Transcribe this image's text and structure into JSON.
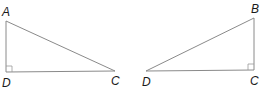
{
  "figure": {
    "triangles": [
      {
        "name": "triangle-ADC",
        "vertices": [
          {
            "label": "A",
            "x": 6,
            "y": 21
          },
          {
            "label": "D",
            "x": 6,
            "y": 72
          },
          {
            "label": "C",
            "x": 115,
            "y": 71
          }
        ],
        "right_angle_at": "D",
        "labels": {
          "A": "A",
          "D": "D",
          "C": "C"
        }
      },
      {
        "name": "triangle-BCD",
        "vertices": [
          {
            "label": "B",
            "x": 254,
            "y": 18
          },
          {
            "label": "C",
            "x": 254,
            "y": 70
          },
          {
            "label": "D",
            "x": 146,
            "y": 71
          }
        ],
        "right_angle_at": "C",
        "labels": {
          "B": "B",
          "C": "C",
          "D": "D"
        }
      }
    ],
    "colors": {
      "edge": "#8a8a8a",
      "label": "#1a1a1a"
    }
  }
}
